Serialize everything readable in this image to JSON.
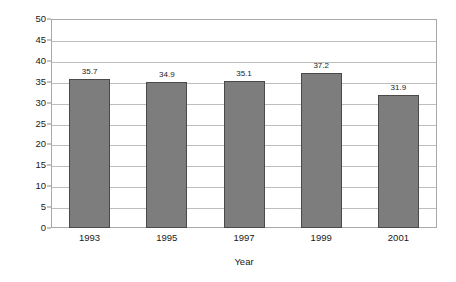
{
  "chart_data": {
    "type": "bar",
    "title": "",
    "subtitle": "",
    "xlabel": "Year",
    "ylabel": "Percent",
    "categories": [
      "1993",
      "1995",
      "1997",
      "1999",
      "2001"
    ],
    "values": [
      35.7,
      34.9,
      35.1,
      37.2,
      31.9
    ],
    "value_labels": [
      "35.7",
      "34.9",
      "35.1",
      "37.2",
      "31.9"
    ],
    "ylim": [
      0,
      50
    ],
    "ytick_labels": [
      "0",
      "5",
      "10",
      "15",
      "20",
      "25",
      "30",
      "35",
      "40",
      "45",
      "50"
    ],
    "ytick_values": [
      0,
      5,
      10,
      15,
      20,
      25,
      30,
      35,
      40,
      45,
      50
    ],
    "grid": true,
    "grid_axis": "y",
    "legend": false,
    "legend_position": "none",
    "series": [
      {
        "name": "Percent",
        "values": [
          35.7,
          34.9,
          35.1,
          37.2,
          31.9
        ]
      }
    ],
    "colors": {
      "bar_fill": "#7d7d7d",
      "bar_border": "#4a4a4a",
      "gridline": "#bdbdbd",
      "frame": "#a8a8a8",
      "text": "#1a1a1a",
      "background": "#ffffff"
    }
  }
}
